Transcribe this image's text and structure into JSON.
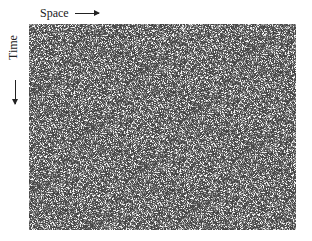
{
  "figure": {
    "type": "cellular-automaton-spacetime-diagram",
    "x_axis_label": "Space",
    "y_axis_label": "Time",
    "x_arrow": "arrow-right",
    "y_arrow": "arrow-down",
    "colors": {
      "background": "#ffffff",
      "cell_dark": "#3c3c3c",
      "cell_light": "#ffffff",
      "text": "#222222"
    },
    "grid": {
      "width_px": 267,
      "height_px": 206,
      "appearance": "random grey noise with scattered white triangles"
    }
  }
}
